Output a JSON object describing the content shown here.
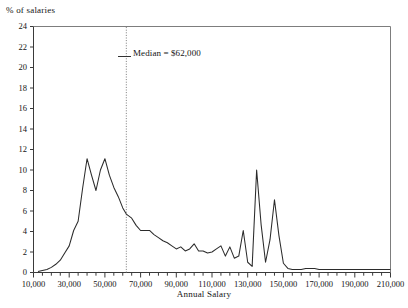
{
  "chart_data": {
    "type": "line",
    "title": "",
    "ylabel": "% of salaries",
    "xlabel": "Annual Salary",
    "xlim": [
      10000,
      210000
    ],
    "ylim": [
      0,
      24
    ],
    "xticks": [
      10000,
      30000,
      50000,
      70000,
      90000,
      110000,
      130000,
      150000,
      170000,
      190000,
      210000
    ],
    "xtick_labels": [
      "10,000",
      "30,000",
      "50,000",
      "70,000",
      "90,000",
      "110,000",
      "130,000",
      "150,000",
      "170,000",
      "190,000",
      "210,000"
    ],
    "minor_tick_step": 5000,
    "yticks": [
      0,
      2,
      4,
      6,
      8,
      10,
      12,
      14,
      16,
      18,
      20,
      22,
      24
    ],
    "ytick_labels": [
      "0",
      "2",
      "4",
      "6",
      "8",
      "10",
      "12",
      "14",
      "16",
      "18",
      "20",
      "22",
      "24"
    ],
    "grid": false,
    "legend": "none",
    "line_color": "#2b2b2b",
    "annotations": [
      {
        "name": "median-line",
        "label": "Median = $62,000",
        "value": 62000,
        "style": "dotted-vertical",
        "color": "#7a7a7a"
      }
    ],
    "x": [
      12500,
      15000,
      17500,
      20000,
      22500,
      25000,
      27500,
      30000,
      32500,
      35000,
      37500,
      40000,
      42500,
      45000,
      47500,
      50000,
      52500,
      55000,
      57500,
      60000,
      62000,
      65000,
      67500,
      70000,
      72500,
      75000,
      77500,
      80000,
      82500,
      85000,
      87500,
      90000,
      92500,
      95000,
      97500,
      100000,
      102500,
      105000,
      107500,
      110000,
      112500,
      115000,
      117500,
      120000,
      122500,
      125000,
      127500,
      130000,
      132500,
      135000,
      137500,
      140000,
      142500,
      145000,
      147500,
      150000,
      152500,
      155000,
      157500,
      160000,
      162500,
      165000,
      167500,
      170000,
      175000,
      180000,
      185000,
      190000,
      195000,
      200000,
      205000,
      210000
    ],
    "y": [
      0.1,
      0.2,
      0.3,
      0.5,
      0.8,
      1.2,
      1.9,
      2.6,
      4.1,
      5.0,
      8.2,
      11.1,
      9.5,
      8.0,
      10.0,
      11.1,
      9.5,
      8.3,
      7.4,
      6.3,
      5.7,
      5.3,
      4.6,
      4.1,
      4.1,
      4.1,
      3.7,
      3.4,
      3.1,
      2.9,
      2.6,
      2.3,
      2.5,
      2.1,
      2.3,
      2.8,
      2.1,
      2.1,
      1.9,
      2.0,
      2.3,
      2.6,
      1.6,
      2.5,
      1.4,
      1.6,
      4.1,
      1.0,
      0.6,
      10.0,
      4.7,
      1.0,
      3.2,
      7.1,
      3.6,
      0.9,
      0.4,
      0.3,
      0.3,
      0.3,
      0.4,
      0.4,
      0.4,
      0.3,
      0.3,
      0.3,
      0.3,
      0.3,
      0.3,
      0.3,
      0.3,
      0.3
    ]
  }
}
